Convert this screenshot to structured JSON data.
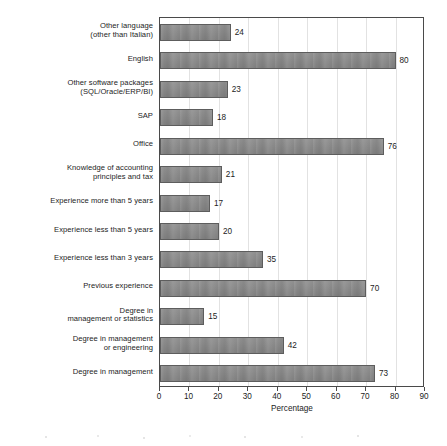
{
  "chart_data": {
    "type": "bar",
    "orientation": "horizontal",
    "title": "",
    "xlabel": "Percentage",
    "ylabel": "",
    "xlim": [
      0,
      90
    ],
    "xticks": [
      0,
      10,
      20,
      30,
      40,
      50,
      60,
      70,
      80,
      90
    ],
    "grid": true,
    "grid_axis": "x",
    "legend": false,
    "bar_color": "#878787",
    "bar_edge_color": "#5d5d5d",
    "value_labels": true,
    "categories": [
      "Other language (other than Italian)",
      "English",
      "Other software packages (SQL/Oracle/ERP/BI)",
      "SAP",
      "Office",
      "Knowledge of accounting principles and tax",
      "Experience more than 5 years",
      "Experience less than 5 years",
      "Experience less than 3 years",
      "Previous experience",
      "Degree in management or statistics",
      "Degree in management or engineering",
      "Degree in management"
    ],
    "category_lines": [
      [
        "Other language",
        "(other than Italian)"
      ],
      [
        "English"
      ],
      [
        "Other software packages",
        "(SQL/Oracle/ERP/BI)"
      ],
      [
        "SAP"
      ],
      [
        "Office"
      ],
      [
        "Knowledge of accounting",
        "principles and tax"
      ],
      [
        "Experience more than 5 years"
      ],
      [
        "Experience less than 5 years"
      ],
      [
        "Experience less than 3 years"
      ],
      [
        "Previous experience"
      ],
      [
        "Degree in",
        "management or statistics"
      ],
      [
        "Degree in management",
        "or engineering"
      ],
      [
        "Degree in management"
      ]
    ],
    "values": [
      24,
      80,
      23,
      18,
      76,
      21,
      17,
      20,
      35,
      70,
      15,
      42,
      73
    ]
  }
}
